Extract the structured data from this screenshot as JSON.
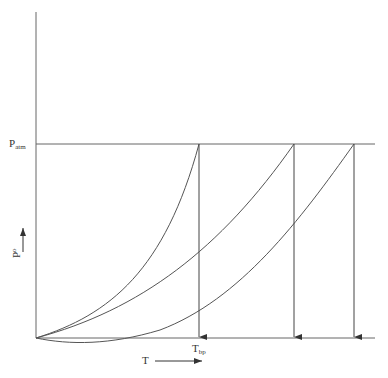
{
  "diagram": {
    "y_axis_label": {
      "main": "P",
      "superscript": "o"
    },
    "x_axis_label": "T",
    "patm_label": {
      "main": "P",
      "subscript": "atm"
    },
    "tbp_label": {
      "main": "T",
      "subscript": "bp"
    },
    "curves": [
      {
        "name": "curve-1",
        "end_x": 199
      },
      {
        "name": "curve-2",
        "end_x": 294
      },
      {
        "name": "curve-3",
        "end_x": 354
      }
    ],
    "line_color": "#555555"
  }
}
